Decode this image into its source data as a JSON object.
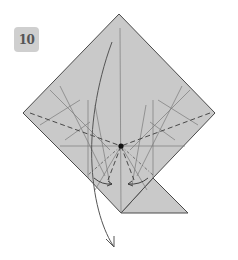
{
  "step": {
    "number": "10"
  },
  "colors": {
    "paper": "#c9c9c9",
    "paper_edge": "#4a4a4a",
    "crease": "#7a7a7a",
    "valley": "#3a3a3a",
    "arrow": "#555555",
    "badge_bg": "#cfcfcf",
    "badge_text": "#555555"
  },
  "diagram": {
    "shape": "diamond-base-with-lower-flap",
    "center_point": [
      121,
      146
    ],
    "arrows": [
      {
        "type": "fold-down",
        "from": [
          112,
          42
        ],
        "to": [
          114,
          247
        ]
      },
      {
        "type": "fold-in-left",
        "from": [
          96,
          180
        ],
        "to": [
          112,
          184
        ]
      },
      {
        "type": "fold-in-right",
        "from": [
          146,
          180
        ],
        "to": [
          128,
          184
        ]
      }
    ]
  }
}
